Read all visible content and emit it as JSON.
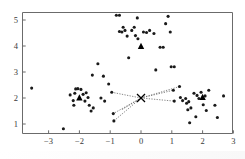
{
  "chart_data": {
    "type": "scatter",
    "title": "",
    "xlabel": "",
    "ylabel": "",
    "xlim": [
      -3.6,
      3.0
    ],
    "ylim": [
      0.55,
      5.35
    ],
    "xticks": [
      -3,
      -2,
      -1,
      0,
      1,
      2,
      3
    ],
    "xticklabels": [
      "−3",
      "−2",
      "−1",
      "0",
      "1",
      "2",
      "3"
    ],
    "yticks": [
      1,
      2,
      3,
      4,
      5
    ],
    "yticklabels": [
      "1",
      "2",
      "3",
      "4",
      "5"
    ],
    "grid": false,
    "legend": null,
    "colors": {
      "point": "#1a1a1a",
      "centroid": "#000000",
      "spoke": "#555555",
      "axis": "#6b6b6b",
      "background": "#ffffff"
    },
    "series": [
      {
        "name": "data-points",
        "marker": "dot",
        "points": [
          [
            -3.55,
            2.38
          ],
          [
            -2.52,
            0.82
          ],
          [
            -2.3,
            2.12
          ],
          [
            -2.15,
            2.18
          ],
          [
            -2.12,
            2.35
          ],
          [
            -2.05,
            2.36
          ],
          [
            -2.2,
            1.9
          ],
          [
            -2.18,
            1.72
          ],
          [
            -1.95,
            2.33
          ],
          [
            -1.88,
            2.14
          ],
          [
            -1.82,
            1.88
          ],
          [
            -1.78,
            2.2
          ],
          [
            -1.72,
            2.02
          ],
          [
            -1.68,
            1.72
          ],
          [
            -1.62,
            1.5
          ],
          [
            -1.58,
            2.88
          ],
          [
            -1.55,
            1.62
          ],
          [
            -1.4,
            3.32
          ],
          [
            -1.3,
            2.0
          ],
          [
            -1.22,
            2.84
          ],
          [
            -1.18,
            1.88
          ],
          [
            -1.05,
            2.54
          ],
          [
            -0.95,
            2.22
          ],
          [
            -0.9,
            1.4
          ],
          [
            -0.88,
            1.12
          ],
          [
            -0.8,
            5.18
          ],
          [
            -0.7,
            5.18
          ],
          [
            -0.7,
            4.56
          ],
          [
            -0.62,
            4.54
          ],
          [
            -0.58,
            4.72
          ],
          [
            -0.52,
            4.6
          ],
          [
            -0.45,
            4.38
          ],
          [
            -0.4,
            3.55
          ],
          [
            -0.3,
            4.6
          ],
          [
            -0.22,
            4.72
          ],
          [
            -0.18,
            4.4
          ],
          [
            -0.12,
            5.08
          ],
          [
            -0.1,
            4.28
          ],
          [
            0.08,
            4.54
          ],
          [
            0.18,
            4.52
          ],
          [
            0.28,
            4.6
          ],
          [
            0.42,
            4.48
          ],
          [
            0.48,
            3.08
          ],
          [
            0.62,
            3.95
          ],
          [
            0.72,
            3.95
          ],
          [
            0.8,
            4.86
          ],
          [
            0.88,
            5.14
          ],
          [
            0.95,
            4.54
          ],
          [
            0.98,
            3.2
          ],
          [
            1.08,
            3.2
          ],
          [
            1.05,
            2.3
          ],
          [
            1.08,
            1.88
          ],
          [
            1.25,
            2.44
          ],
          [
            1.28,
            2.02
          ],
          [
            1.35,
            1.9
          ],
          [
            1.45,
            1.98
          ],
          [
            1.48,
            1.8
          ],
          [
            1.52,
            1.55
          ],
          [
            1.55,
            1.86
          ],
          [
            1.58,
            1.05
          ],
          [
            1.62,
            1.62
          ],
          [
            1.72,
            2.18
          ],
          [
            1.78,
            1.28
          ],
          [
            1.82,
            2.1
          ],
          [
            1.88,
            1.98
          ],
          [
            1.95,
            2.22
          ],
          [
            2.02,
            1.74
          ],
          [
            2.08,
            2.08
          ],
          [
            2.12,
            1.52
          ],
          [
            2.2,
            2.3
          ],
          [
            2.4,
            1.72
          ],
          [
            2.48,
            1.25
          ],
          [
            2.68,
            2.08
          ]
        ]
      },
      {
        "name": "cluster-centroids",
        "marker": "triangle",
        "points": [
          [
            -2.0,
            2.0
          ],
          [
            0.0,
            3.98
          ],
          [
            2.0,
            2.02
          ]
        ]
      },
      {
        "name": "query-point",
        "marker": "x",
        "points": [
          [
            0.0,
            2.0
          ]
        ]
      }
    ],
    "connections": {
      "name": "nearest-neighbor-spokes",
      "from": [
        0.0,
        2.0
      ],
      "to": [
        [
          -0.95,
          2.22
        ],
        [
          -0.9,
          1.4
        ],
        [
          -0.88,
          1.12
        ],
        [
          -0.62,
          1.55
        ],
        [
          1.05,
          2.3
        ],
        [
          1.08,
          1.88
        ],
        [
          1.25,
          2.44
        ]
      ]
    }
  }
}
